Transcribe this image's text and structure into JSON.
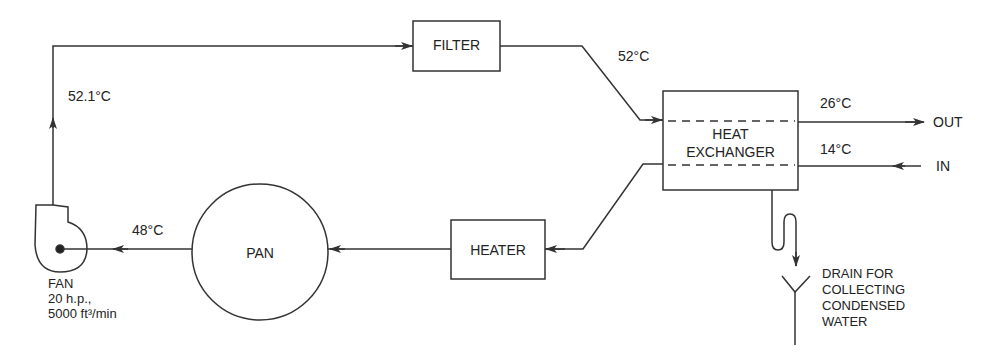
{
  "diagram": {
    "type": "process-flow",
    "components": {
      "filter": {
        "label": "FILTER"
      },
      "heat_exchanger": {
        "label_line1": "HEAT",
        "label_line2": "EXCHANGER"
      },
      "heater": {
        "label": "HEATER"
      },
      "pan": {
        "label": "PAN"
      },
      "fan": {
        "label": "FAN",
        "power": "20 h.p.,",
        "flow": "5000 ft³/min"
      },
      "drain": {
        "line1": "DRAIN FOR",
        "line2": "COLLECTING",
        "line3": "CONDENSED",
        "line4": "WATER"
      }
    },
    "temperatures": {
      "after_fan": "52.1°C",
      "after_filter": "52°C",
      "coolant_out": "26°C",
      "coolant_in": "14°C",
      "after_pan": "48°C"
    },
    "ports": {
      "out": "OUT",
      "in": "IN"
    },
    "colors": {
      "line": "#333333",
      "background": "#ffffff"
    }
  }
}
